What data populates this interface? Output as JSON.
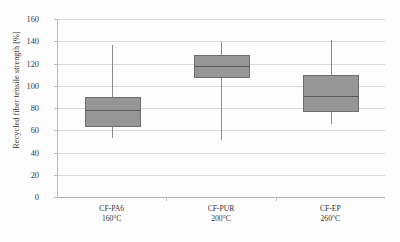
{
  "chart_data": {
    "type": "box",
    "title": "",
    "xlabel": "",
    "ylabel": "Recycled fiber tensile strength [%]",
    "ylim": [
      0,
      160
    ],
    "ytick_step": 20,
    "yticks": [
      0,
      20,
      40,
      60,
      80,
      100,
      120,
      140,
      160
    ],
    "grid": true,
    "legend": "none",
    "categories": [
      {
        "name": "CF-PA6",
        "temperature": "160°C"
      },
      {
        "name": "CF-PUR",
        "temperature": "200°C"
      },
      {
        "name": "CF-EP",
        "temperature": "260°C"
      }
    ],
    "series": [
      {
        "name": "CF-PA6",
        "min": 53,
        "q1": 63,
        "median": 78,
        "q3": 90,
        "max": 137
      },
      {
        "name": "CF-PUR",
        "min": 51,
        "q1": 107,
        "median": 118,
        "q3": 128,
        "max": 139
      },
      {
        "name": "CF-EP",
        "min": 66,
        "q1": 76,
        "median": 91,
        "q3": 110,
        "max": 141
      }
    ],
    "box_fill_color": "#969696",
    "box_edge_color": "#6e6e6e",
    "gridline_color": "#d9d9d9",
    "axis_color": "#b9b9b9"
  },
  "yaxis": {
    "title": "Recycled fiber tensile strength [%]",
    "ticks": [
      "0",
      "20",
      "40",
      "60",
      "80",
      "100",
      "120",
      "140",
      "160"
    ]
  },
  "xaxis": {
    "groups": [
      {
        "line1": "CF-PA6",
        "line2": "160°C"
      },
      {
        "line1": "CF-PUR",
        "line2": "200°C"
      },
      {
        "line1": "CF-EP",
        "line2": "260°C"
      }
    ]
  }
}
